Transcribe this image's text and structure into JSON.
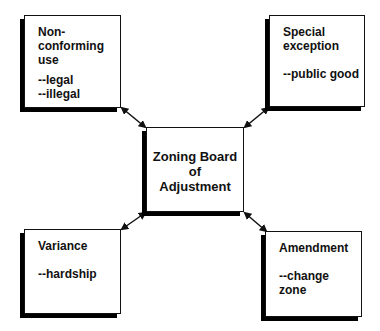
{
  "diagram": {
    "center": {
      "label": "Zoning Board\nof\nAdjustment"
    },
    "nodes": [
      {
        "id": "non-conforming-use",
        "title": "Non-\nconforming\nuse",
        "sub": "--legal\n--illegal",
        "position": "top-left"
      },
      {
        "id": "special-exception",
        "title": "Special\nexception",
        "sub": "--public good",
        "position": "top-right"
      },
      {
        "id": "variance",
        "title": "Variance",
        "sub": "--hardship",
        "position": "bottom-left"
      },
      {
        "id": "amendment",
        "title": "Amendment",
        "sub": "--change\n  zone",
        "position": "bottom-right"
      }
    ],
    "edges": [
      {
        "from": "non-conforming-use",
        "to": "zoning-board",
        "style": "bidirectional-arrow"
      },
      {
        "from": "special-exception",
        "to": "zoning-board",
        "style": "bidirectional-arrow"
      },
      {
        "from": "variance",
        "to": "zoning-board",
        "style": "bidirectional-arrow"
      },
      {
        "from": "amendment",
        "to": "zoning-board",
        "style": "bidirectional-arrow"
      }
    ],
    "colors": {
      "stroke": "#111111",
      "shadow": "#000000",
      "background": "#ffffff"
    }
  }
}
